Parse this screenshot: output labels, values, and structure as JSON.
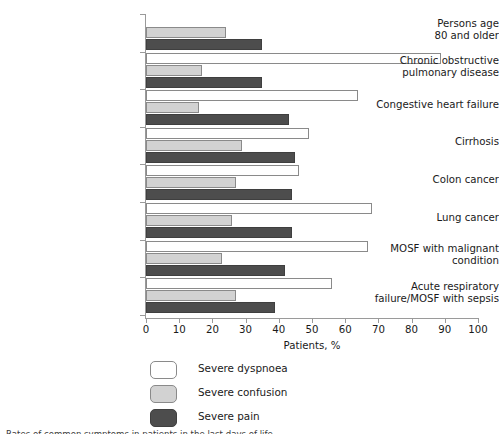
{
  "chart_data": {
    "type": "bar",
    "orientation": "horizontal",
    "title": "",
    "xlabel": "Patients, %",
    "ylabel": "",
    "xlim": [
      0,
      100
    ],
    "xticks": [
      0,
      10,
      20,
      30,
      40,
      50,
      60,
      70,
      80,
      90,
      100
    ],
    "xtick_labels": [
      "0",
      "10",
      "20",
      "30",
      "40",
      "50",
      "60",
      "70",
      "80",
      "90",
      "100"
    ],
    "grid": false,
    "legend_position": "bottom-left",
    "categories": [
      "Persons age 80 and older",
      "Chronic obstructive pulmonary disease",
      "Congestive heart failure",
      "Cirrhosis",
      "Colon cancer",
      "Lung cancer",
      "MOSF with malignant condition",
      "Acute respiratory failure/MOSF with sepsis"
    ],
    "series": [
      {
        "name": "Severe dyspnoea",
        "color": "#ffffff",
        "values": [
          0,
          89,
          64,
          49,
          46,
          68,
          67,
          56
        ]
      },
      {
        "name": "Severe confusion",
        "color": "#d2d2d2",
        "values": [
          24,
          17,
          16,
          29,
          27,
          26,
          23,
          27
        ]
      },
      {
        "name": "Severe pain",
        "color": "#4d4d4d",
        "values": [
          35,
          35,
          43,
          45,
          44,
          44,
          42,
          39
        ]
      }
    ]
  },
  "axis": {
    "x_title": "Patients, %",
    "tick_labels": [
      "0",
      "10",
      "20",
      "30",
      "40",
      "50",
      "60",
      "70",
      "80",
      "90",
      "100"
    ]
  },
  "categories": [
    {
      "lines": [
        "Persons age",
        "80 and older"
      ]
    },
    {
      "lines": [
        "Chronic obstructive",
        "pulmonary disease"
      ]
    },
    {
      "lines": [
        "Congestive heart failure"
      ]
    },
    {
      "lines": [
        "Cirrhosis"
      ]
    },
    {
      "lines": [
        "Colon cancer"
      ]
    },
    {
      "lines": [
        "Lung cancer"
      ]
    },
    {
      "lines": [
        "MOSF with malignant",
        "condition"
      ]
    },
    {
      "lines": [
        "Acute respiratory",
        "failure/MOSF with sepsis"
      ]
    }
  ],
  "legend": {
    "items": [
      {
        "label": "Severe dyspnoea",
        "swatch": "white"
      },
      {
        "label": "Severe confusion",
        "swatch": "light-gray"
      },
      {
        "label": "Severe pain",
        "swatch": "dark-gray"
      }
    ]
  },
  "caption": {
    "text": "Rates of common symptoms in patients in the last days of life"
  },
  "colors": {
    "dyspnoea": "#ffffff",
    "confusion": "#d2d2d2",
    "pain": "#4d4d4d",
    "axis": "#9a9a9a",
    "text": "#1a1a1a"
  }
}
